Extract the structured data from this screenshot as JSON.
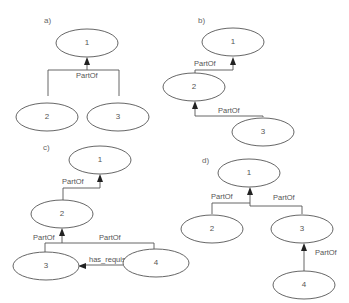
{
  "panels": [
    {
      "id": "a",
      "label": "a)",
      "nodes": [
        {
          "id": "1",
          "label": "1"
        },
        {
          "id": "2",
          "label": "2"
        },
        {
          "id": "3",
          "label": "3"
        }
      ],
      "edges": [
        {
          "from": "2",
          "to": "1",
          "label": "PartOf"
        },
        {
          "from": "3",
          "to": "1",
          "label": "PartOf"
        }
      ],
      "edge_labels": [
        "PartOf"
      ]
    },
    {
      "id": "b",
      "label": "b)",
      "nodes": [
        {
          "id": "1",
          "label": "1"
        },
        {
          "id": "2",
          "label": "2"
        },
        {
          "id": "3",
          "label": "3"
        }
      ],
      "edges": [
        {
          "from": "2",
          "to": "1",
          "label": "PartOf"
        },
        {
          "from": "3",
          "to": "2",
          "label": "PartOf"
        }
      ],
      "edge_labels": [
        "PartOf",
        "PartOf"
      ]
    },
    {
      "id": "c",
      "label": "c)",
      "nodes": [
        {
          "id": "1",
          "label": "1"
        },
        {
          "id": "2",
          "label": "2"
        },
        {
          "id": "3",
          "label": "3"
        },
        {
          "id": "4",
          "label": "4"
        }
      ],
      "edges": [
        {
          "from": "2",
          "to": "1",
          "label": "PartOf"
        },
        {
          "from": "3",
          "to": "2",
          "label": "PartOf"
        },
        {
          "from": "4",
          "to": "2",
          "label": "PartOf"
        },
        {
          "from": "4",
          "to": "3",
          "label": "has_requisite"
        }
      ],
      "edge_labels": [
        "PartOf",
        "PartOf",
        "PartOf",
        "has_requisite"
      ]
    },
    {
      "id": "d",
      "label": "d)",
      "nodes": [
        {
          "id": "1",
          "label": "1"
        },
        {
          "id": "2",
          "label": "2"
        },
        {
          "id": "3",
          "label": "3"
        },
        {
          "id": "4",
          "label": "4"
        }
      ],
      "edges": [
        {
          "from": "2",
          "to": "1",
          "label": "PartOf"
        },
        {
          "from": "3",
          "to": "1",
          "label": "PartOf"
        },
        {
          "from": "4",
          "to": "3",
          "label": "PartOf"
        }
      ],
      "edge_labels": [
        "PartOf",
        "PartOf",
        "PartOf"
      ]
    }
  ]
}
